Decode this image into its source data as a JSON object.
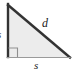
{
  "figure": {
    "kind": "right-triangle-diagram",
    "labels": {
      "hypotenuse": "d",
      "base": "s",
      "height": "s"
    },
    "colors": {
      "fill": "#ececec",
      "stroke_dark": "#333333",
      "stroke_light": "#9a9a9a",
      "background": "#ffffff",
      "label": "#1a1a1a"
    },
    "geometry": {
      "apex_x": 8,
      "apex_y": 5,
      "right_angle_x": 8,
      "right_angle_y": 57,
      "far_x": 70,
      "far_y": 57,
      "right_angle_marker_size": 9
    }
  }
}
